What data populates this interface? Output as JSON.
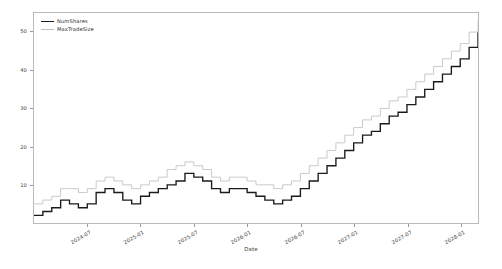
{
  "chart_data": {
    "type": "line",
    "subtype": "step",
    "title": "",
    "xlabel": "Date",
    "ylabel": "",
    "grid": false,
    "legend_position": "upper-left",
    "ylim": [
      0,
      55
    ],
    "yticks": [
      10,
      20,
      30,
      40,
      50
    ],
    "ytick_labels": [
      "10",
      "20",
      "30",
      "40",
      "50"
    ],
    "xlim": [
      "2024-01",
      "2028-04"
    ],
    "xticks": [
      "2024-07",
      "2025-01",
      "2025-07",
      "2026-01",
      "2026-07",
      "2027-01",
      "2027-07",
      "2028-01"
    ],
    "xtick_labels": [
      "2024-07",
      "2025-01",
      "2025-07",
      "2026-01",
      "2026-07",
      "2027-01",
      "2027-07",
      "2028-01"
    ],
    "x": [
      "2024-01",
      "2024-02",
      "2024-03",
      "2024-04",
      "2024-05",
      "2024-06",
      "2024-07",
      "2024-08",
      "2024-09",
      "2024-10",
      "2024-11",
      "2024-12",
      "2025-01",
      "2025-02",
      "2025-03",
      "2025-04",
      "2025-05",
      "2025-06",
      "2025-07",
      "2025-08",
      "2025-09",
      "2025-10",
      "2025-11",
      "2025-12",
      "2026-01",
      "2026-02",
      "2026-03",
      "2026-04",
      "2026-05",
      "2026-06",
      "2026-07",
      "2026-08",
      "2026-09",
      "2026-10",
      "2026-11",
      "2026-12",
      "2027-01",
      "2027-02",
      "2027-03",
      "2027-04",
      "2027-05",
      "2027-06",
      "2027-07",
      "2027-08",
      "2027-09",
      "2027-10",
      "2027-11",
      "2027-12",
      "2028-01",
      "2028-02",
      "2028-03"
    ],
    "series": [
      {
        "name": "NumShares",
        "color": "#1a1a1a",
        "values": [
          2,
          3,
          4,
          6,
          5,
          4,
          5,
          8,
          9,
          8,
          6,
          5,
          7,
          8,
          9,
          10,
          11,
          13,
          12,
          11,
          9,
          8,
          9,
          9,
          8,
          7,
          6,
          5,
          6,
          7,
          9,
          11,
          13,
          15,
          17,
          19,
          21,
          23,
          24,
          26,
          28,
          29,
          31,
          33,
          35,
          37,
          39,
          41,
          43,
          46,
          50
        ]
      },
      {
        "name": "MaxTradeSize",
        "color": "#c0c0c0",
        "values": [
          5,
          6,
          7,
          9,
          9,
          8,
          9,
          11,
          12,
          11,
          10,
          9,
          10,
          11,
          12,
          14,
          15,
          16,
          15,
          14,
          12,
          11,
          12,
          12,
          11,
          10,
          10,
          9,
          10,
          11,
          13,
          15,
          17,
          19,
          21,
          23,
          25,
          27,
          28,
          30,
          32,
          33,
          35,
          37,
          39,
          41,
          43,
          45,
          47,
          50,
          53
        ]
      }
    ]
  },
  "legend": {
    "entries": [
      {
        "label": "NumShares",
        "color": "#1a1a1a"
      },
      {
        "label": "MaxTradeSize",
        "color": "#c0c0c0"
      }
    ]
  },
  "axes": {
    "x_title": "Date"
  }
}
